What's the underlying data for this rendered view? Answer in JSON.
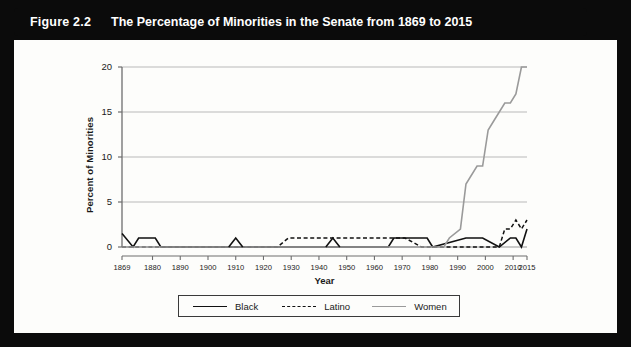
{
  "figure": {
    "number": "Figure 2.2",
    "title": "The Percentage of Minorities in the Senate from 1869 to 2015"
  },
  "chart_data": {
    "type": "line",
    "title": "The Percentage of Minorities in the Senate from 1869 to 2015",
    "xlabel": "Year",
    "ylabel": "Percent of Minorities",
    "xlim": [
      1869,
      2015
    ],
    "ylim": [
      0,
      20
    ],
    "yticks": [
      0,
      5,
      10,
      15,
      20
    ],
    "ytick_labels": [
      "0",
      "5",
      "10",
      "15",
      "20"
    ],
    "xticks": [
      1869,
      1880,
      1890,
      1900,
      1910,
      1920,
      1930,
      1940,
      1950,
      1960,
      1970,
      1980,
      1990,
      2000,
      2010,
      2015
    ],
    "xtick_labels": [
      "1869",
      "1880",
      "1890",
      "1900",
      "1910",
      "1920",
      "1930",
      "1940",
      "1950",
      "1960",
      "1970",
      "1980",
      "1990",
      "2000",
      "2010",
      "2015"
    ],
    "grid": "horizontal",
    "legend_position": "below",
    "colors": {
      "black_series": "#111111",
      "latino_series": "#111111",
      "women_series": "#9a9a9a",
      "grid": "#b9b9b9",
      "axis": "#6e6e6e"
    },
    "series": [
      {
        "name": "Black",
        "style": "solid",
        "color": "#111111",
        "x": [
          1869,
          1873,
          1875,
          1881,
          1883,
          1965,
          1967,
          1979,
          1981,
          1993,
          1999,
          2005,
          2009,
          2011,
          2013,
          2015
        ],
        "y": [
          1.5,
          0,
          1,
          1,
          0,
          0,
          1,
          1,
          0,
          1,
          1,
          0,
          1,
          1,
          0,
          2
        ]
      },
      {
        "name": "Latino",
        "style": "dashed",
        "color": "#111111",
        "x": [
          1869,
          1925,
          1929,
          1935,
          1957,
          1965,
          1971,
          1977,
          2005,
          2007,
          2009,
          2011,
          2013,
          2015
        ],
        "y": [
          0,
          0,
          1,
          1,
          1,
          1,
          1,
          0,
          0,
          2,
          2,
          3,
          2,
          3
        ]
      },
      {
        "name": "Women",
        "style": "solid",
        "color": "#9a9a9a",
        "x": [
          1869,
          1985,
          1987,
          1991,
          1993,
          1997,
          1999,
          2001,
          2003,
          2007,
          2009,
          2011,
          2013,
          2015
        ],
        "y": [
          0,
          0,
          1,
          2,
          7,
          9,
          9,
          13,
          14,
          16,
          16,
          17,
          20,
          20
        ]
      }
    ],
    "annotations": [
      {
        "year": 1910,
        "label": "small Black spike",
        "value": 1
      },
      {
        "year": 1945,
        "label": "small Black spike",
        "value": 1
      }
    ]
  },
  "legend": {
    "entries": [
      {
        "label": "Black",
        "style": "solid",
        "color": "#111111"
      },
      {
        "label": "Latino",
        "style": "dashed",
        "color": "#111111"
      },
      {
        "label": "Women",
        "style": "solid",
        "color": "#9a9a9a"
      }
    ]
  }
}
